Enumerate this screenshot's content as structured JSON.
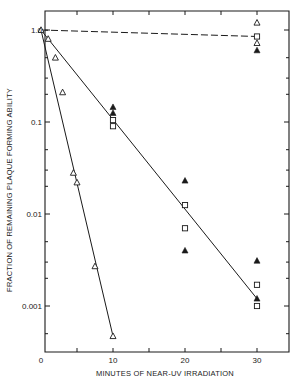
{
  "chart_data": {
    "type": "scatter",
    "title": "",
    "xlabel": "MINUTES OF NEAR-UV IRRADIATION",
    "ylabel": "FRACTION OF REMAINING PLAQUE FORMING ABILITY",
    "xscale": "linear",
    "yscale": "log",
    "xlim": [
      0,
      33
    ],
    "ylim": [
      0.0003,
      3
    ],
    "x_ticks": [
      0,
      10,
      20,
      30
    ],
    "x_tick_labels": [
      "0",
      "10",
      "20",
      "30"
    ],
    "y_ticks": [
      1.0,
      0.1,
      0.01,
      0.001
    ],
    "y_tick_labels": [
      "1.0",
      "0.1",
      "0.01",
      "0.001"
    ],
    "grid": false,
    "legend": null,
    "series": [
      {
        "name": "open-triangle-fast-decay",
        "marker": "open-triangle",
        "points": [
          [
            0,
            1.0
          ],
          [
            1,
            0.8
          ],
          [
            2,
            0.5
          ],
          [
            3,
            0.21
          ],
          [
            4.5,
            0.028
          ],
          [
            5,
            0.022
          ],
          [
            7.5,
            0.0027
          ],
          [
            10,
            0.00047
          ]
        ]
      },
      {
        "name": "filled-triangle",
        "marker": "filled-triangle",
        "points": [
          [
            10,
            0.145
          ],
          [
            10,
            0.125
          ],
          [
            20,
            0.023
          ],
          [
            20,
            0.004
          ],
          [
            30,
            0.0031
          ],
          [
            30,
            0.0012
          ],
          [
            30,
            0.6
          ]
        ]
      },
      {
        "name": "open-square",
        "marker": "open-square",
        "points": [
          [
            10,
            0.105
          ],
          [
            10,
            0.09
          ],
          [
            20,
            0.0125
          ],
          [
            20,
            0.007
          ],
          [
            30,
            0.0017
          ],
          [
            30,
            0.001
          ],
          [
            30,
            0.85
          ]
        ]
      },
      {
        "name": "open-triangle-control",
        "marker": "open-triangle",
        "points": [
          [
            30,
            1.2
          ],
          [
            30,
            0.72
          ]
        ]
      }
    ],
    "lines": [
      {
        "name": "fast-decay-fit",
        "style": "solid",
        "from": [
          0,
          1.0
        ],
        "to": [
          10,
          0.00047
        ]
      },
      {
        "name": "slow-decay-fit",
        "style": "solid",
        "from": [
          0,
          1.0
        ],
        "to": [
          30,
          0.0012
        ]
      },
      {
        "name": "control-fit",
        "style": "dashed",
        "from": [
          0,
          1.0
        ],
        "to": [
          30,
          0.85
        ]
      }
    ]
  }
}
